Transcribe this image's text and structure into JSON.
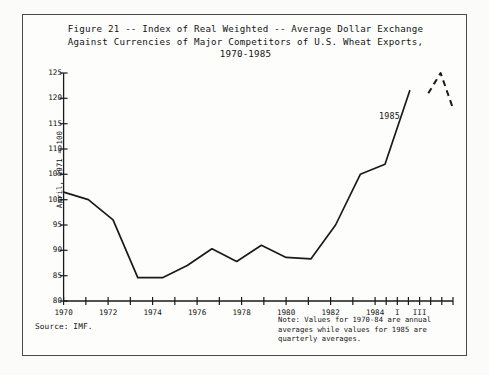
{
  "figure": {
    "title": "Figure 21 -- Index of Real Weighted -- Average Dollar Exchange\nAgainst Currencies of Major Competitors of U.S. Wheat Exports,\n1970-1985",
    "source": "Source:  IMF.",
    "note": "Note:  Values for 1970-84 are annual\naverages while values for 1985 are\nquarterly averages.",
    "annotation_1985": "1985"
  },
  "chart_data": {
    "type": "line",
    "title": "Figure 21 -- Index of Real Weighted -- Average Dollar Exchange Against Currencies of Major Competitors of U.S. Wheat Exports, 1970-1985",
    "xlabel": "",
    "ylabel": "April, 1971 = 100",
    "ylim": [
      80,
      125
    ],
    "yticks": [
      80,
      85,
      90,
      95,
      100,
      105,
      110,
      115,
      120,
      125
    ],
    "ytick_labels": [
      "80",
      "85",
      "90",
      "95",
      "100",
      "105",
      "110",
      "115",
      "120",
      "125"
    ],
    "xlim": [
      1970,
      1985.75
    ],
    "xticks": [
      1970,
      1971,
      1972,
      1973,
      1974,
      1975,
      1976,
      1977,
      1978,
      1979,
      1980,
      1981,
      1982,
      1983,
      1984,
      1984.5,
      1985.0,
      1985.25,
      1985.5
    ],
    "xtick_labels": [
      "1970",
      "1972",
      "1974",
      "1976",
      "1978",
      "1980",
      "1982",
      "1984",
      "I",
      "III"
    ],
    "xtick_label_positions": [
      1970,
      1972,
      1974,
      1976,
      1978,
      1980,
      1982,
      1984,
      1985.0,
      1985.5
    ],
    "grid": false,
    "legend": null,
    "series": [
      {
        "name": "Annual averages 1970-84",
        "style": "solid",
        "color": "#1a1a1a",
        "x": [
          1970,
          1971,
          1972,
          1973,
          1974,
          1975,
          1976,
          1977,
          1978,
          1979,
          1980,
          1981,
          1982,
          1983,
          1984
        ],
        "values": [
          101.5,
          100.0,
          96.0,
          84.6,
          84.6,
          87.0,
          90.3,
          87.8,
          91.0,
          88.6,
          88.3,
          95.0,
          105.0,
          107.0,
          121.5
        ]
      },
      {
        "name": "Quarterly averages 1985",
        "style": "dashed",
        "color": "#1a1a1a",
        "x": [
          1984.75,
          1985.0,
          1985.25,
          1985.5,
          1985.75
        ],
        "x_labels": [
          "",
          "I",
          "II",
          "III",
          "IV"
        ],
        "values": [
          121.0,
          123.0,
          125.0,
          121.5,
          118.0
        ]
      }
    ],
    "annotations": [
      {
        "text": "1985",
        "x": 1985.15,
        "y": 119.5
      }
    ]
  }
}
